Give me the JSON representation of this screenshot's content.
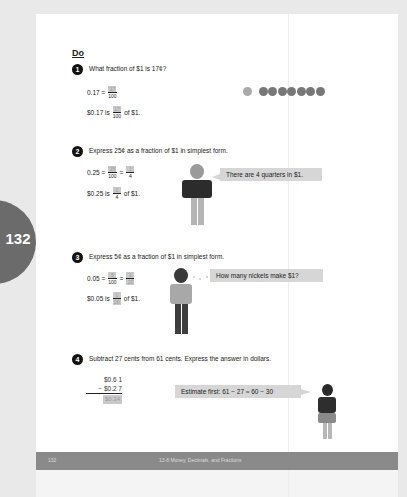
{
  "page": {
    "number": "132",
    "section_heading": "Do"
  },
  "footer": {
    "page_number": "132",
    "chapter_title": "13-8 Money, Decimals, and Fractions"
  },
  "questions": [
    {
      "number": "1",
      "prompt": "What fraction of $1 is 17¢?",
      "lines": [
        {
          "lhs": "0.17 =",
          "fraction": {
            "numerator": "17",
            "denominator": "100"
          }
        },
        {
          "lhs": "$0.17 is",
          "fraction": {
            "numerator": "17",
            "denominator": "100"
          },
          "rhs": "of $1."
        }
      ],
      "coins": {
        "dimes": 1,
        "pennies": 7
      }
    },
    {
      "number": "2",
      "prompt": "Express 25¢ as a fraction of $1 in simplest form.",
      "lines": [
        {
          "lhs": "0.25 =",
          "fraction": {
            "numerator": "25",
            "denominator": "100"
          },
          "eq": "=",
          "fraction2": {
            "numerator": "1",
            "denominator": "4"
          }
        },
        {
          "lhs": "$0.25 is",
          "fraction": {
            "numerator": "1",
            "denominator": "4"
          },
          "rhs": "of $1."
        }
      ],
      "speech_bubble": "There are 4 quarters in $1."
    },
    {
      "number": "3",
      "prompt": "Express 5¢ as a fraction of $1 in simplest form.",
      "lines": [
        {
          "lhs": "0.05 =",
          "fraction": {
            "numerator": "5",
            "denominator": "100"
          },
          "eq": "=",
          "fraction2": {
            "numerator": "1",
            "denominator": "20"
          }
        },
        {
          "lhs": "$0.05 is",
          "fraction": {
            "numerator": "1",
            "denominator": "20"
          },
          "rhs": "of $1."
        }
      ],
      "thought_bubble": "How many nickels make $1?"
    },
    {
      "number": "4",
      "prompt": "Subtract 27 cents from 61 cents. Express the answer in dollars.",
      "subtraction": {
        "top": "$0.6 1",
        "bottom": "− $0.2 7",
        "answer": "$0.34"
      },
      "speech_bubble": "Estimate first: 61 − 27 ≈ 60 − 30"
    }
  ]
}
